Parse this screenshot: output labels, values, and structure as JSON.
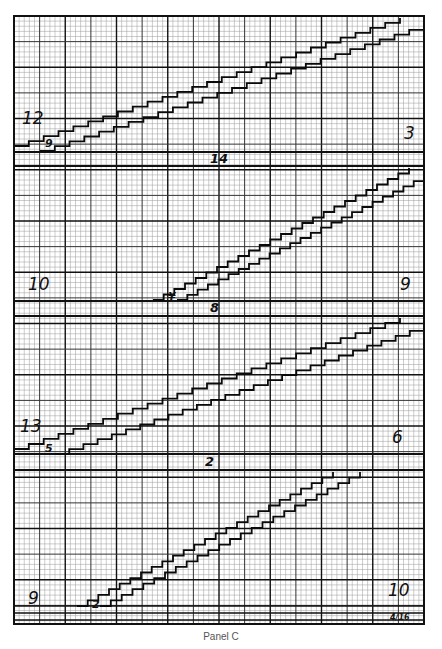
{
  "figure": {
    "caption": "Panel C",
    "grid": {
      "left": 14,
      "right": 424,
      "top": 16,
      "bottom": 624,
      "minor_spacing": 5.125,
      "major_every": 5,
      "heavy_every": 10,
      "colors": {
        "minor": "#9a9a9a",
        "major": "#333333",
        "heavy": "#111111",
        "trace": "#0a0a0a"
      }
    },
    "separators": [
      {
        "label": "14",
        "y_top": 152,
        "y_bottom": 166,
        "label_x": 210,
        "label_y": 163
      },
      {
        "label": "8",
        "y_top": 301,
        "y_bottom": 316,
        "label_x": 210,
        "label_y": 312
      },
      {
        "label": "2",
        "y_top": 454,
        "y_bottom": 470,
        "label_x": 205,
        "label_y": 466
      }
    ],
    "panels": [
      {
        "name": "panel-1",
        "left_label": "12",
        "left_label_x": 22,
        "left_label_y": 124,
        "right_label": "3",
        "right_label_x": 404,
        "right_label_y": 139,
        "marker": "9",
        "marker_x": 45,
        "marker_y": 147,
        "upper_trace": {
          "x0": 14,
          "y0": 146,
          "x1": 400,
          "y1": 18,
          "steps": 26
        },
        "lower_trace": {
          "x0": 40,
          "y0": 151,
          "x1": 424,
          "y1": 25,
          "steps": 26
        }
      },
      {
        "name": "panel-2",
        "left_label": "10",
        "left_label_x": 28,
        "left_label_y": 290,
        "right_label": "9",
        "right_label_x": 400,
        "right_label_y": 290,
        "marker": "¥",
        "marker_x": 168,
        "marker_y": 300,
        "upper_trace": {
          "x0": 153,
          "y0": 300,
          "x1": 409,
          "y1": 168,
          "steps": 24
        },
        "lower_trace": {
          "x0": 177,
          "y0": 300,
          "x1": 424,
          "y1": 176,
          "steps": 24
        }
      },
      {
        "name": "panel-3",
        "left_label": "13",
        "left_label_x": 20,
        "left_label_y": 432,
        "right_label": "6",
        "right_label_x": 392,
        "right_label_y": 443,
        "marker": "5",
        "marker_x": 45,
        "marker_y": 452,
        "upper_trace": {
          "x0": 14,
          "y0": 449,
          "x1": 400,
          "y1": 318,
          "steps": 26
        },
        "lower_trace": {
          "x0": 55,
          "y0": 454,
          "x1": 424,
          "y1": 326,
          "steps": 26
        }
      },
      {
        "name": "panel-4",
        "left_label": "9",
        "left_label_x": 28,
        "left_label_y": 604,
        "right_label": "10",
        "right_label_x": 388,
        "right_label_y": 596,
        "marker": "2",
        "marker_x": 92,
        "marker_y": 608,
        "footnote": "4/16",
        "footnote_x": 390,
        "footnote_y": 620,
        "upper_trace": {
          "x0": 77,
          "y0": 606,
          "x1": 333,
          "y1": 472,
          "steps": 24
        },
        "lower_trace": {
          "x0": 100,
          "y0": 606,
          "x1": 360,
          "y1": 472,
          "steps": 24
        }
      }
    ],
    "bottom_lines": [
      606,
      613,
      620
    ]
  }
}
